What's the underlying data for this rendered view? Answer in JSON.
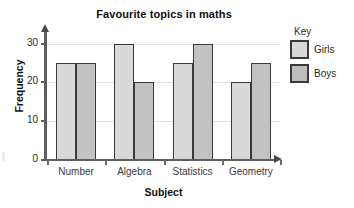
{
  "chart_data": {
    "type": "bar",
    "title": "Favourite topics in maths",
    "xlabel": "Subject",
    "ylabel": "Frequency",
    "categories": [
      "Number",
      "Algebra",
      "Statistics",
      "Geometry"
    ],
    "series": [
      {
        "name": "Girls",
        "values": [
          25,
          30,
          25,
          20
        ],
        "color": "#d9d9d9"
      },
      {
        "name": "Boys",
        "values": [
          25,
          20,
          30,
          25
        ],
        "color": "#c2c2c2"
      }
    ],
    "ylim": [
      0,
      33
    ],
    "yticks": [
      0,
      10,
      20,
      30
    ],
    "ytick_labels": [
      "0",
      "10",
      "20",
      "30"
    ],
    "grid": true,
    "legend": {
      "title": "Key",
      "position": "right",
      "entries": [
        "Girls",
        "Boys"
      ]
    }
  }
}
